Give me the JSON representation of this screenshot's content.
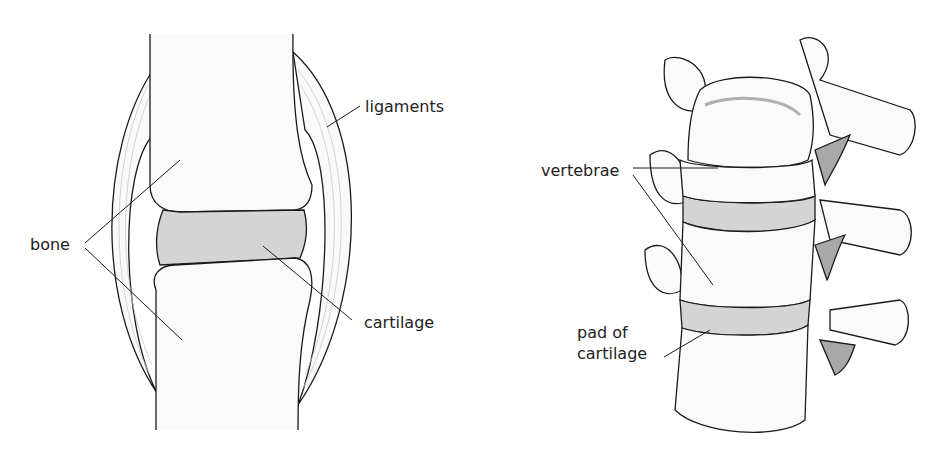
{
  "diagrams": [
    {
      "id": "joint",
      "labels": {
        "ligaments": "ligaments",
        "bone": "bone",
        "cartilage": "cartilage"
      }
    },
    {
      "id": "spine",
      "labels": {
        "vertebrae": "vertebrae",
        "pad_line1": "pad of",
        "pad_line2": "cartilage"
      }
    }
  ],
  "colors": {
    "outline": "#1a1a1a",
    "bone_fill": "#fafafa",
    "cartilage_fill": "#d4d4d4",
    "shadow_fill": "#a8a8a8",
    "ligament_lines": "#bdbdbd"
  }
}
